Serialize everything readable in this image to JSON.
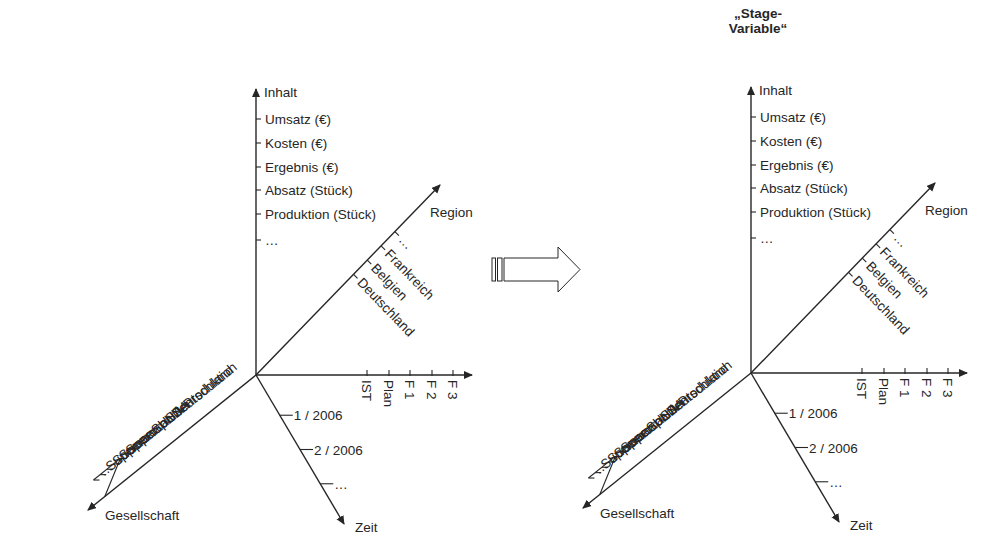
{
  "colors": {
    "ink": "#262626",
    "background": "#ffffff"
  },
  "transition_arrow": {
    "icon": "block-arrow-right-icon"
  },
  "diagrams": [
    {
      "name": "left",
      "offset": [
        0,
        0
      ],
      "title": null,
      "axes": {
        "inhalt": {
          "label": "Inhalt",
          "items": [
            "Umsatz (€)",
            "Kosten (€)",
            "Ergebnis (€)",
            "Absatz (Stück)",
            "Produktion (Stück)",
            "…"
          ]
        },
        "region": {
          "label": "Region",
          "items": [
            "Deutschland",
            "Belgien",
            "Frankreich",
            "…"
          ]
        },
        "gesellschaft": {
          "label": "Gesellschaft",
          "items": [
            "Supercar Deutschland",
            "Supercar USA",
            "Supercar USA-Produktion",
            "Supercar Spanien",
            "…"
          ]
        },
        "szenario": {
          "label": "",
          "items": [
            "IST",
            "Plan",
            "F 1",
            "F 2",
            "F 3"
          ]
        },
        "zeit": {
          "label": "Zeit",
          "items": [
            "1 / 2006",
            "2 / 2006",
            "…"
          ]
        }
      }
    },
    {
      "name": "right",
      "offset": [
        495,
        -2
      ],
      "title": [
        "„Stage-",
        "Variable“"
      ],
      "axes": {
        "inhalt": {
          "label": "Inhalt",
          "items": [
            "Umsatz (€)",
            "Kosten (€)",
            "Ergebnis (€)",
            "Absatz (Stück)",
            "Produktion (Stück)",
            "…"
          ]
        },
        "region": {
          "label": "Region",
          "items": [
            "Deutschland",
            "Belgien",
            "Frankreich",
            "…"
          ]
        },
        "gesellschaft": {
          "label": "Gesellschaft",
          "items": [
            "Supercar Deutschland",
            "Supercar USA",
            "Supercar USA-Produktion",
            "Supercar Spanien",
            "…"
          ]
        },
        "szenario": {
          "label": "",
          "items": [
            "IST",
            "Plan",
            "F 1",
            "F 2",
            "F 3"
          ]
        },
        "zeit": {
          "label": "Zeit",
          "items": [
            "1 / 2006",
            "2 / 2006",
            "…"
          ]
        }
      }
    }
  ]
}
